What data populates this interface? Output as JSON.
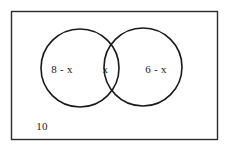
{
  "diagram": {
    "type": "venn-two-set",
    "title": "",
    "background_color": "#ffffff",
    "stroke_color": "#1a1a1a",
    "text_color": "#1a1a1a",
    "universe": {
      "label": "10",
      "shape": "rectangle",
      "stroke_color": "#2b2b2b"
    },
    "regions": [
      {
        "id": "left-only",
        "label": "8 - x"
      },
      {
        "id": "intersection",
        "label": "x"
      },
      {
        "id": "right-only",
        "label": "6 - x"
      },
      {
        "id": "outside",
        "label": "10"
      }
    ],
    "left_region_label": "8 - x",
    "intersection_label": "x",
    "right_region_label": "6 - x",
    "outside_label": "10"
  }
}
